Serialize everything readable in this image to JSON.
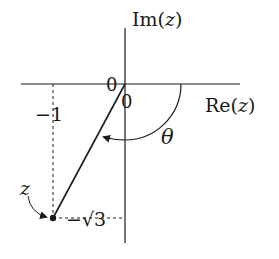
{
  "diagram": {
    "type": "complex-plane",
    "axes": {
      "imag_label_prefix": "Im(",
      "imag_label_var": "z",
      "imag_label_suffix": ")",
      "real_label_prefix": "Re(",
      "real_label_var": "z",
      "real_label_suffix": ")"
    },
    "origin_labels": [
      "0",
      "0"
    ],
    "real_coordinate_label": "−1",
    "imag_coordinate_label": "−√3",
    "point_label": "z",
    "angle_label": "θ",
    "point": {
      "re": -1,
      "im": -1.7320508
    },
    "colors": {
      "ink": "#1a1a1a",
      "background": "#ffffff"
    }
  }
}
